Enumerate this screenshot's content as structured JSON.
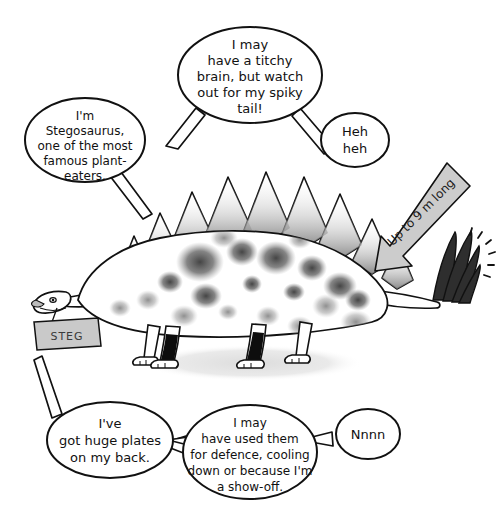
{
  "scene": {
    "title": "Stegosaurus cartoon illustration",
    "background_color": "#ffffff",
    "ink_color": "#111111",
    "shadow_color": "#e2e2e2",
    "arrow_fill": "#cccccc",
    "tag_fill": "#c9c9c9",
    "spike_fill": "#333333",
    "leg_shade": "#111111"
  },
  "speech_bubbles": [
    {
      "id": "top",
      "lines": [
        "I may",
        "have a titchy",
        "brain, but watch",
        "out for my spiky",
        "tail!"
      ]
    },
    {
      "id": "left",
      "lines": [
        "I'm",
        "Stegosaurus,",
        "one of the most",
        "famous plant-",
        "eaters."
      ]
    },
    {
      "id": "right",
      "lines": [
        "Heh",
        "heh"
      ]
    },
    {
      "id": "bottom-left",
      "lines": [
        "I've",
        "got huge plates",
        "on my back."
      ]
    },
    {
      "id": "bottom-center",
      "lines": [
        "I may",
        "have used them",
        "for defence, cooling",
        "down or because I'm",
        "a show-off."
      ]
    },
    {
      "id": "bottom-right",
      "lines": [
        "Nnnn"
      ]
    }
  ],
  "annotations": {
    "size_arrow_label": "Up to 9 m long",
    "name_tag_label": "STEG"
  },
  "creature": {
    "name": "Stegosaurus",
    "plate_count": 11,
    "tail_spike_count": 4,
    "leg_count": 4
  }
}
